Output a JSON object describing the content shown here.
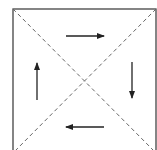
{
  "diagram": {
    "colors": {
      "stroke": "#444444",
      "dash": "#666666",
      "background": "#ffffff"
    },
    "box": {
      "x": 13,
      "y": 9,
      "w": 143,
      "h": 144
    },
    "center": {
      "x": 85,
      "y": 81
    },
    "arrows": [
      {
        "name": "top-arrow-right",
        "x1": 66,
        "y1": 36,
        "x2": 104,
        "y2": 36,
        "direction": "right"
      },
      {
        "name": "right-arrow-down",
        "x1": 132,
        "y1": 62,
        "x2": 132,
        "y2": 98,
        "direction": "down"
      },
      {
        "name": "bottom-arrow-left",
        "x1": 104,
        "y1": 127,
        "x2": 66,
        "y2": 127,
        "direction": "left"
      },
      {
        "name": "left-arrow-up",
        "x1": 37,
        "y1": 100,
        "x2": 37,
        "y2": 63,
        "direction": "up"
      }
    ]
  }
}
